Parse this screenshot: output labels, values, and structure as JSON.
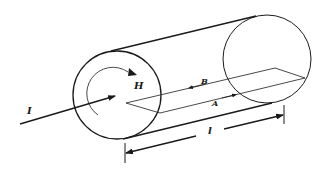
{
  "figure": {
    "colors": {
      "stroke": "#1a1a1a",
      "background": "#ffffff"
    },
    "labels": {
      "current": "I",
      "field": "H",
      "path_b": "B",
      "path_a": "A",
      "length": "l"
    }
  }
}
